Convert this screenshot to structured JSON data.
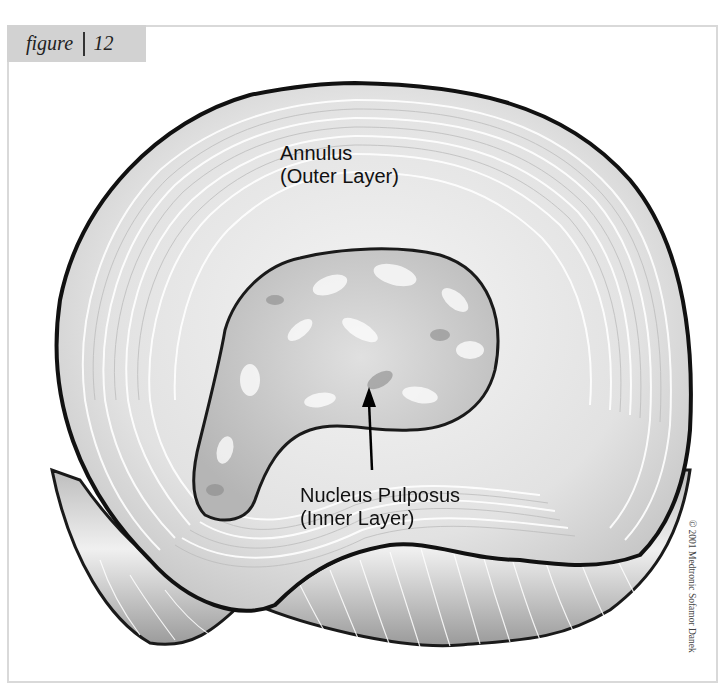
{
  "figure_tab": {
    "label": "figure",
    "number": "12",
    "background": "#d2d2d2"
  },
  "diagram": {
    "labels": {
      "annulus_line1": "Annulus",
      "annulus_line2": "(Outer Layer)",
      "nucleus_line1": "Nucleus Pulposus",
      "nucleus_line2": "(Inner Layer)"
    },
    "pointer": "arrow from Nucleus Pulposus label up into nucleus"
  },
  "credit": "© 2001 Medtronic Sofamor Danek",
  "colors": {
    "frame_border": "#d9d9d9",
    "outline": "#1a1a1a",
    "annulus_fill": "#e6e6e6",
    "nucleus_fill": "#cfcfcf"
  }
}
